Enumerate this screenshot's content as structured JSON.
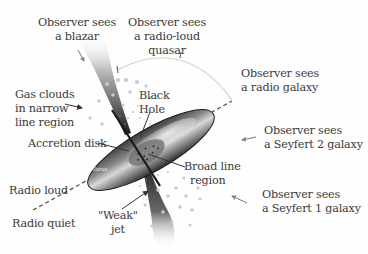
{
  "diagram": {
    "labels": {
      "blazar": [
        "Observer sees",
        "a blazar"
      ],
      "radio_loud_quasar": [
        "Observer sees",
        "a radio-loud",
        "quasar"
      ],
      "radio_galaxy": [
        "Observer sees",
        "a radio galaxy"
      ],
      "seyfert2": [
        "Observer sees",
        "a Seyfert 2 galaxy"
      ],
      "seyfert1": [
        "Observer sees",
        "a Seyfert 1 galaxy"
      ],
      "gas_clouds": [
        "Gas clouds",
        "in narrow",
        "line region"
      ],
      "black_hole": [
        "Black",
        "Hole"
      ],
      "accretion_disk": "Accretion disk",
      "torus": "Torus",
      "broad_line_region": [
        "Broad line",
        "region"
      ],
      "radio_loud": "Radio loud",
      "radio_quiet": "Radio quiet",
      "weak_jet": [
        "\"Weak\"",
        "jet"
      ]
    },
    "colors": {
      "text": "#3a3a3a",
      "torus_dark": "#2e2e2e",
      "torus_light": "#d9d9d9",
      "jet": "#1e1e1e",
      "dots": "#c8c8c8",
      "arc": "#cfcfcf"
    }
  }
}
